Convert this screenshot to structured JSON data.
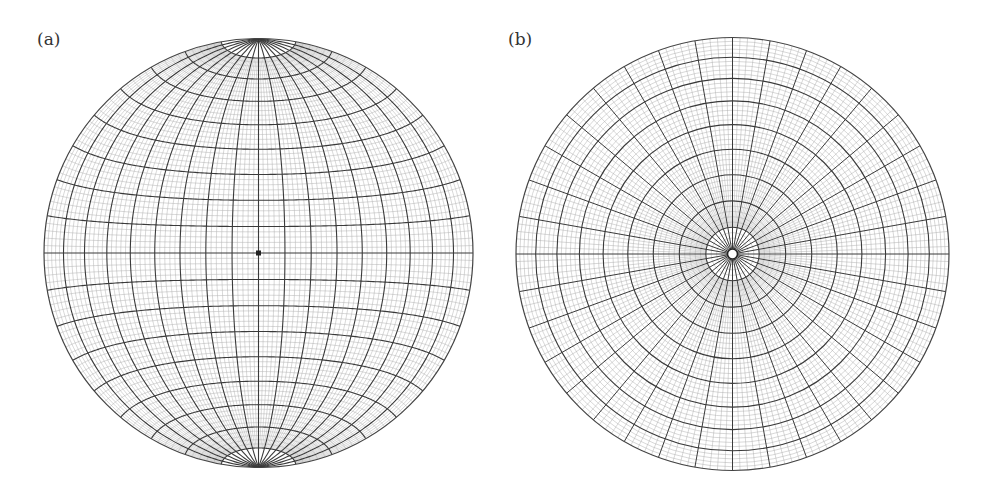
{
  "figure": {
    "panels": [
      {
        "label": "(a)",
        "type": "equatorial equal-area (Schmidt) net",
        "center": [
          258.5,
          253
        ],
        "radius": 214.5,
        "major_interval_deg": 10,
        "minor_interval_deg": 2,
        "minor_cap_cutoff_deg": 80
      },
      {
        "label": "(b)",
        "type": "polar equal-area (Schmidt) net",
        "center": [
          732.5,
          254
        ],
        "radius": 216.5,
        "major_interval_deg": 10,
        "minor_interval_deg": 2,
        "minor_radial_cutoff_deg": 10
      }
    ],
    "colors": {
      "major_line": "#3a3a3a",
      "minor_line": "#a8a8a8",
      "rim": "#444444",
      "background": "#ffffff"
    }
  }
}
